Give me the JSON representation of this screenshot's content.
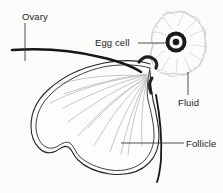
{
  "diagram": {
    "type": "biological-line-drawing",
    "background_color": "#fbfbfa",
    "ink_color": "#1d1d1d",
    "interior_line_color": "#b9b9b9",
    "wall_fill_color": "#3a3a3a",
    "labels": [
      {
        "id": "ovary",
        "text": "Ovary",
        "x": 22,
        "y": 11,
        "leader": "vertical-down"
      },
      {
        "id": "eggcell",
        "text": "Egg cell",
        "x": 95,
        "y": 37,
        "leader": "horizontal-right"
      },
      {
        "id": "fluid",
        "text": "Fluid",
        "x": 178,
        "y": 97,
        "leader": "vertical-up"
      },
      {
        "id": "follicle",
        "text": "Follicle",
        "x": 186,
        "y": 138,
        "leader": "horizontal-left"
      }
    ],
    "structures": [
      {
        "id": "ovary-surface",
        "name": "ovary surface outline"
      },
      {
        "id": "follicle-wall",
        "name": "stippled follicle wall"
      },
      {
        "id": "follicle-cavity",
        "name": "fluid-filled antrum with radiating strands"
      },
      {
        "id": "cumulus-mass",
        "name": "granulosa cell mass"
      },
      {
        "id": "egg-cell",
        "name": "oocyte ring with nucleus"
      }
    ]
  }
}
